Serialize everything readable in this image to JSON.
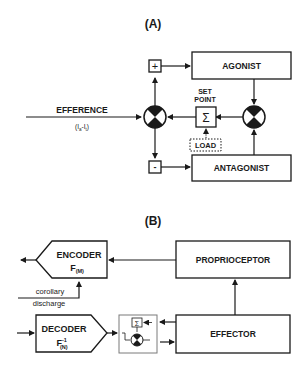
{
  "panel_a": {
    "title": "(A)",
    "efference_label": "EFFERENCE",
    "efference_sub_main": "(I",
    "efference_sub_a": "a",
    "efference_sub_mid": "-I",
    "efference_sub_t": "t",
    "efference_sub_end": ")",
    "plus_sign": "+",
    "minus_sign": "-",
    "agonist": "AGONIST",
    "antagonist": "ANTAGONIST",
    "set_point_line1": "SET",
    "set_point_line2": "POINT",
    "sigma": "Σ",
    "load": "LOAD"
  },
  "panel_b": {
    "title": "(B)",
    "encoder": "ENCODER",
    "encoder_fn": "F",
    "encoder_sub": "(M)",
    "decoder": "DECODER",
    "decoder_fn": "F",
    "decoder_sup": "-1",
    "decoder_sub": "(N)",
    "proprioceptor": "PROPRIOCEPTOR",
    "effector": "EFFECTOR",
    "corollary_line1": "corollary",
    "corollary_line2": "discharge",
    "sigma": "Σ"
  },
  "colors": {
    "ink": "#1a1a1a",
    "background": "#ffffff",
    "inset_border": "#7a7a7a"
  }
}
